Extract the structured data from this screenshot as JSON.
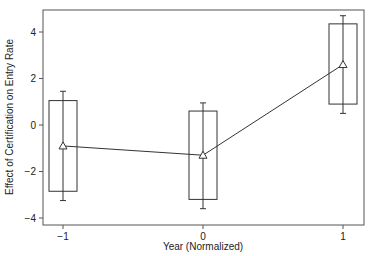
{
  "chart_data": {
    "type": "line",
    "title": "",
    "xlabel": "Year (Normalized)",
    "ylabel": "Effect of Certification on Entry Rate",
    "x": [
      -1,
      0,
      1
    ],
    "xticks": [
      -1,
      0,
      1
    ],
    "xtick_labels": [
      "−1",
      "0",
      "1"
    ],
    "yticks": [
      -4,
      -2,
      0,
      2,
      4
    ],
    "ytick_labels": [
      "−4",
      "−2",
      "0",
      "2",
      "4"
    ],
    "xlim": [
      -1.15,
      1.15
    ],
    "ylim": [
      -4.2,
      5.0
    ],
    "grid": false,
    "legend": "none",
    "series": [
      {
        "name": "Point estimate",
        "marker": "triangle",
        "values": [
          -0.9,
          -1.3,
          2.6
        ],
        "box_upper": [
          1.05,
          0.6,
          4.35
        ],
        "box_lower": [
          -2.85,
          -3.2,
          0.9
        ],
        "whisker_upper": [
          1.45,
          0.95,
          4.7
        ],
        "whisker_lower": [
          -3.25,
          -3.6,
          0.5
        ]
      }
    ],
    "colors": {
      "line": "#333333",
      "box": "#333333",
      "axis": "#555555"
    }
  }
}
